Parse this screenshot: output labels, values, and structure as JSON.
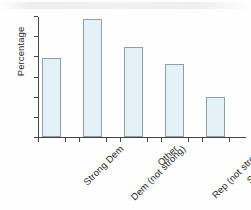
{
  "chart_data": {
    "type": "bar",
    "title": "",
    "xlabel": "",
    "ylabel": "Percentage",
    "categories": [
      "Strong Dem",
      "Dem (not strong)",
      "Other",
      "Rep (not strong)",
      "Strong Rep"
    ],
    "values": [
      19.7,
      29.2,
      22.4,
      18.2,
      10.0
    ],
    "ylim": [
      0,
      30
    ],
    "yticks": [
      0,
      5,
      10,
      15,
      20,
      25,
      30
    ],
    "ytick_labels": [
      "0",
      "5",
      "10",
      "15",
      "20",
      "25",
      "30"
    ],
    "grid": false,
    "legend": null,
    "bar_fill_color": "#e4f1f7",
    "bar_border_color": "#8e9fa8",
    "axis_color": "#444444"
  }
}
